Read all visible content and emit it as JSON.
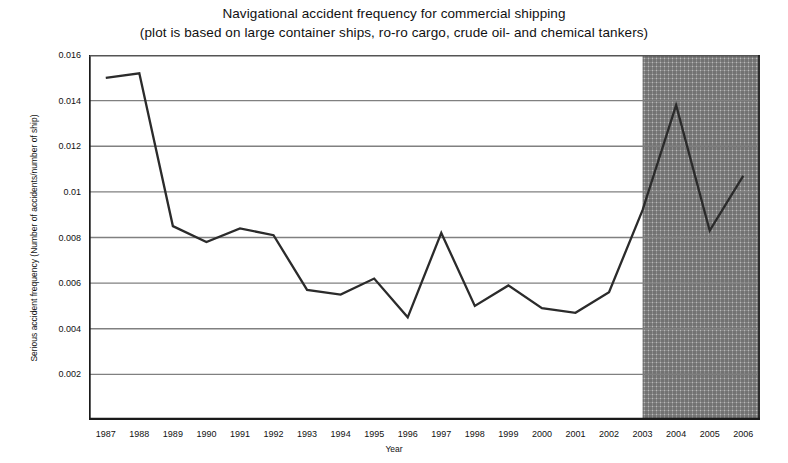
{
  "chart_data": {
    "type": "line",
    "title": "Navigational accident frequency for commercial shipping",
    "subtitle": "(plot is based on large container ships, ro-ro cargo, crude oil- and chemical tankers)",
    "xlabel": "Year",
    "ylabel": "Serious accident frequency (Number of accidents/number of ship)",
    "xlim": [
      1986.5,
      2006.5
    ],
    "ylim": [
      0,
      0.016
    ],
    "grid": true,
    "legend": null,
    "categories": [
      "1987",
      "1988",
      "1989",
      "1990",
      "1991",
      "1992",
      "1993",
      "1994",
      "1995",
      "1996",
      "1997",
      "1998",
      "1999",
      "2000",
      "2001",
      "2002",
      "2003",
      "2004",
      "2005",
      "2006"
    ],
    "x": [
      1987,
      1988,
      1989,
      1990,
      1991,
      1992,
      1993,
      1994,
      1995,
      1996,
      1997,
      1998,
      1999,
      2000,
      2001,
      2002,
      2003,
      2004,
      2005,
      2006
    ],
    "values": [
      0.015,
      0.0152,
      0.0085,
      0.0078,
      0.0084,
      0.0081,
      0.0057,
      0.0055,
      0.0062,
      0.0045,
      0.0082,
      0.005,
      0.0059,
      0.0049,
      0.0047,
      0.0056,
      0.0092,
      0.0138,
      0.0083,
      0.0107
    ],
    "ytick_labels": [
      "0.002",
      "0.004",
      "0.006",
      "0.008",
      "0.01",
      "0.012",
      "0.014",
      "0.016"
    ],
    "ytick_values": [
      0.002,
      0.004,
      0.006,
      0.008,
      0.01,
      0.012,
      0.014,
      0.016
    ],
    "shaded_region": {
      "label": "",
      "x_start": 2003,
      "x_end": 2006.5,
      "pattern": "crosshatch",
      "color": "#8c8c8c"
    },
    "line_color": "#2b2b2b",
    "grid_color": "#808080",
    "axis_color": "#1a1a1a"
  }
}
